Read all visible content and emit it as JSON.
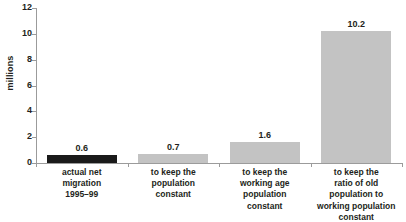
{
  "chart_data": {
    "type": "bar",
    "title": "",
    "xlabel": "",
    "ylabel": "millions",
    "ylim": [
      0,
      12
    ],
    "yticks": [
      0,
      2,
      4,
      6,
      8,
      10,
      12
    ],
    "grid": false,
    "legend": "none",
    "categories": [
      "actual net migration 1995–99",
      "to keep the population constant",
      "to keep the working age population constant",
      "to keep the ratio of old population to working population constant"
    ],
    "category_lines": [
      [
        "actual net",
        "migration",
        "1995–99"
      ],
      [
        "to keep the",
        "population",
        "constant"
      ],
      [
        "to keep the",
        "working age",
        "population",
        "constant"
      ],
      [
        "to keep the",
        "ratio of old",
        "population to",
        "working population",
        "constant"
      ]
    ],
    "values": [
      0.6,
      0.7,
      1.6,
      10.2
    ],
    "value_labels": [
      "0.6",
      "0.7",
      "1.6",
      "10.2"
    ],
    "bar_colors": [
      "#1a1a1a",
      "#c3c3c3",
      "#c3c3c3",
      "#c3c3c3"
    ],
    "tick_labels": [
      "0",
      "2",
      "4",
      "6",
      "8",
      "10",
      "12"
    ]
  },
  "axis": {
    "y_title": "millions",
    "axis_color": "#9b9b9b"
  }
}
